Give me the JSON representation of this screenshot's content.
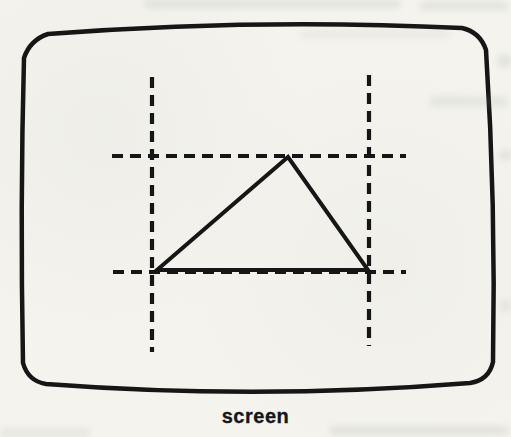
{
  "figure": {
    "caption": "screen",
    "type": "scanned-book-diagram",
    "colors": {
      "ink": "#161616",
      "paper": "#f4f3ee"
    },
    "canvas": {
      "width": 511,
      "height": 437
    },
    "screen_outline": {
      "corners": {
        "top_left": [
          30,
          40
        ],
        "top_right": [
          480,
          32
        ],
        "bottom_right": [
          489,
          380
        ],
        "bottom_left": [
          28,
          381
        ]
      },
      "bulge": {
        "top_y": 18,
        "right_x": 496,
        "bottom_y": 400,
        "left_x": 20
      },
      "corner_radius": 18,
      "stroke_width": 4.5
    },
    "clip_window": {
      "style": "dashed",
      "stroke_width": 4.2,
      "dash": [
        11,
        7
      ],
      "lines": [
        {
          "name": "clip-line-top",
          "x1": 112,
          "y1": 156,
          "x2": 406,
          "y2": 156
        },
        {
          "name": "clip-line-bottom",
          "x1": 113,
          "y1": 272,
          "x2": 406,
          "y2": 272
        },
        {
          "name": "clip-line-left",
          "x1": 152,
          "y1": 77,
          "x2": 152,
          "y2": 352
        },
        {
          "name": "clip-line-right",
          "x1": 369,
          "y1": 75,
          "x2": 369,
          "y2": 346
        }
      ]
    },
    "triangle": {
      "points": [
        [
          157,
          270
        ],
        [
          368,
          270
        ],
        [
          288,
          157
        ]
      ],
      "stroke_width": 4
    }
  }
}
